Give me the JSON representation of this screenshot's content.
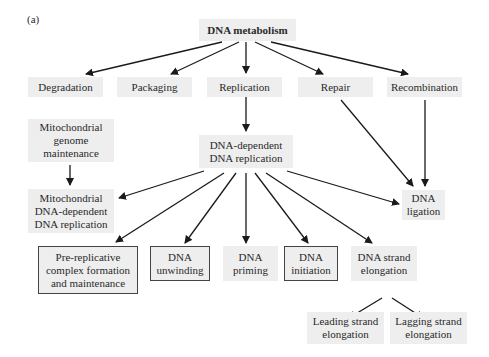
{
  "panel_label": "(a)",
  "nodes": {
    "root": {
      "label": "DNA metabolism"
    },
    "degradation": {
      "label": "Degradation"
    },
    "packaging": {
      "label": "Packaging"
    },
    "replication": {
      "label": "Replication"
    },
    "repair": {
      "label": "Repair"
    },
    "recombination": {
      "label": "Recombination"
    },
    "mito_genome": {
      "label": "Mitochondrial\ngenome\nmaintenance"
    },
    "dna_dep_rep": {
      "label": "DNA-dependent\nDNA replication"
    },
    "mito_dna_rep": {
      "label": "Mitochondrial\nDNA-dependent\nDNA replication"
    },
    "ligation": {
      "label": "DNA\nligation"
    },
    "prereplicative": {
      "label": "Pre-replicative\ncomplex formation\nand maintenance"
    },
    "unwinding": {
      "label": "DNA\nunwinding"
    },
    "priming": {
      "label": "DNA\npriming"
    },
    "initiation": {
      "label": "DNA\ninitiation"
    },
    "strand_elong": {
      "label": "DNA strand\nelongation"
    },
    "leading": {
      "label": "Leading strand\nelongation"
    },
    "lagging": {
      "label": "Lagging strand\nelongation"
    }
  },
  "edges": [
    [
      "root",
      "degradation"
    ],
    [
      "root",
      "packaging"
    ],
    [
      "root",
      "replication"
    ],
    [
      "root",
      "repair"
    ],
    [
      "root",
      "recombination"
    ],
    [
      "replication",
      "dna_dep_rep"
    ],
    [
      "repair",
      "ligation"
    ],
    [
      "recombination",
      "ligation"
    ],
    [
      "mito_genome",
      "mito_dna_rep"
    ],
    [
      "dna_dep_rep",
      "mito_dna_rep"
    ],
    [
      "dna_dep_rep",
      "prereplicative"
    ],
    [
      "dna_dep_rep",
      "unwinding"
    ],
    [
      "dna_dep_rep",
      "priming"
    ],
    [
      "dna_dep_rep",
      "initiation"
    ],
    [
      "dna_dep_rep",
      "strand_elong"
    ],
    [
      "dna_dep_rep",
      "ligation"
    ],
    [
      "strand_elong",
      "leading"
    ],
    [
      "strand_elong",
      "lagging"
    ]
  ],
  "colors": {
    "box_fill": "#eeeeee",
    "arrow": "#1a1a1a",
    "outline": "#444444"
  }
}
